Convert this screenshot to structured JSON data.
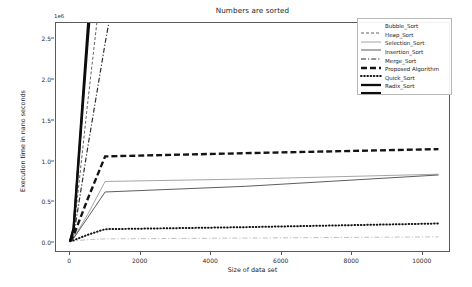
{
  "chart_data": {
    "type": "line",
    "title": "Numbers are sorted",
    "xlabel": "Size of data set",
    "ylabel": "Execution time in nano seconds",
    "y_offset_text": "1e6",
    "xlim": [
      -400,
      10800
    ],
    "ylim": [
      -120000,
      2700000
    ],
    "xticks": [
      0,
      2000,
      4000,
      6000,
      8000,
      10000
    ],
    "xtick_labels": [
      "0",
      "2000",
      "4000",
      "6000",
      "8000",
      "10000"
    ],
    "yticks": [
      0,
      500000,
      1000000,
      1500000,
      2000000,
      2500000
    ],
    "ytick_labels": [
      "0.0",
      "0.5",
      "1.0",
      "1.5",
      "2.0",
      "2.5"
    ],
    "grid": false,
    "legend_position": "upper right",
    "x": [
      0,
      100,
      500,
      1000,
      5000,
      10500
    ],
    "series": [
      {
        "name": "Bubble_Sort",
        "style": "fine-dashed",
        "values": [
          0,
          90000,
          1700000,
          3600000,
          18000000,
          38000000
        ]
      },
      {
        "name": "Heap_Sort",
        "style": "light-solid",
        "values": [
          0,
          40000,
          330000,
          740000,
          770000,
          830000
        ]
      },
      {
        "name": "Selection_Sort",
        "style": "solid",
        "values": [
          0,
          35000,
          290000,
          610000,
          680000,
          820000
        ]
      },
      {
        "name": "Insertion_Sort",
        "style": "dash-dot",
        "values": [
          0,
          60000,
          1150000,
          2450000,
          12000000,
          26000000
        ]
      },
      {
        "name": "Merge_Sort",
        "style": "thick-dashed",
        "values": [
          0,
          70000,
          520000,
          1050000,
          1090000,
          1140000
        ]
      },
      {
        "name": "Proposed Algorithm",
        "style": "dotted",
        "values": [
          0,
          12000,
          80000,
          150000,
          175000,
          220000
        ]
      },
      {
        "name": "Quick_Sort",
        "style": "thick-solid",
        "values": [
          0,
          160000,
          2600000,
          5400000,
          27000000,
          56000000
        ]
      },
      {
        "name": "Radix_Sort",
        "style": "thick-solid-2",
        "values": [
          0,
          150000,
          2450000,
          5100000,
          26000000,
          53000000
        ]
      }
    ],
    "extra_series": [
      {
        "name": "low-flat-trace",
        "style": "dash-dot-light",
        "values": [
          0,
          5000,
          20000,
          30000,
          40000,
          55000
        ]
      }
    ]
  }
}
